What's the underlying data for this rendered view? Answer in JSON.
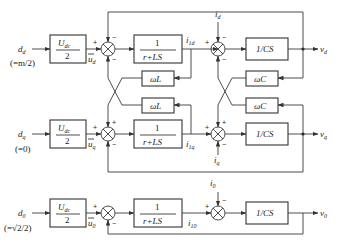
{
  "diagram": {
    "type": "block-diagram",
    "title": "",
    "rows": [
      {
        "id": "d",
        "input": "d",
        "input_sub": "d",
        "input_note": "(=m/2)",
        "gain_num": "U",
        "gain_num_sub": "dc",
        "gain_den": "2",
        "u_label": "u",
        "u_sub": "d",
        "sum1_signs": [
          "+",
          "−",
          "−"
        ],
        "plant_num": "1",
        "plant_den": "r+LS",
        "current": "i",
        "current_sub": "1d",
        "disturbance": "i",
        "disturbance_sub": "d",
        "sum2_signs": [
          "+",
          "−",
          "−"
        ],
        "cap_block": "1/CS",
        "output": "v",
        "output_sub": "d"
      },
      {
        "id": "q",
        "input": "d",
        "input_sub": "q",
        "input_note": "(=0)",
        "gain_num": "U",
        "gain_num_sub": "dc",
        "gain_den": "2",
        "u_label": "u",
        "u_sub": "q",
        "sum1_signs": [
          "+",
          "+",
          "−"
        ],
        "plant_num": "1",
        "plant_den": "r+LS",
        "current": "i",
        "current_sub": "1q",
        "disturbance": "i",
        "disturbance_sub": "q",
        "sum2_signs": [
          "+",
          "+",
          "−"
        ],
        "cap_block": "1/CS",
        "output": "v",
        "output_sub": "q"
      },
      {
        "id": "0",
        "input": "d",
        "input_sub": "0",
        "input_note": "(=√2/2)",
        "gain_num": "U",
        "gain_num_sub": "dc",
        "gain_den": "2",
        "u_label": "u",
        "u_sub": "0",
        "sum1_signs": [
          "+",
          "−"
        ],
        "plant_num": "1",
        "plant_den": "r+LS",
        "current": "i",
        "current_sub": "10",
        "disturbance": "i",
        "disturbance_sub": "0",
        "sum2_signs": [
          "+",
          "−"
        ],
        "cap_block": "1/CS",
        "output": "v",
        "output_sub": "0"
      }
    ],
    "coupling_blocks": {
      "inductive": "ωL",
      "capacitive": "ωC"
    }
  }
}
